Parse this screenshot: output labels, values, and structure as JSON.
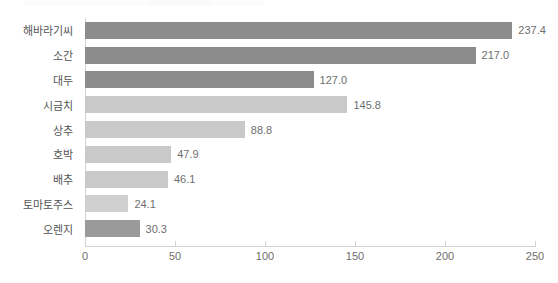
{
  "chart_data": {
    "type": "bar",
    "orientation": "horizontal",
    "title": "",
    "xlabel": "",
    "ylabel": "",
    "categories": [
      "해바라기씨",
      "소간",
      "대두",
      "시금치",
      "상추",
      "호박",
      "배추",
      "토마토주스",
      "오렌지"
    ],
    "values": [
      237.4,
      217.0,
      127.0,
      145.8,
      88.8,
      47.9,
      46.1,
      24.1,
      30.3
    ],
    "value_labels": [
      "237.4",
      "217.0",
      "127.0",
      "145.8",
      "88.8",
      "47.9",
      "46.1",
      "24.1",
      "30.3"
    ],
    "bar_colors": [
      "#8c8c8c",
      "#8c8c8c",
      "#8c8c8c",
      "#c9c9c9",
      "#c9c9c9",
      "#c9c9c9",
      "#c9c9c9",
      "#cfcfcf",
      "#9a9a9a"
    ],
    "xlim": [
      0,
      250
    ],
    "xticks": [
      0,
      50,
      100,
      150,
      200,
      250
    ],
    "xtick_labels": [
      "0",
      "50",
      "100",
      "150",
      "200",
      "250"
    ],
    "grid": false,
    "legend": "none",
    "axis_color": "#d2d2d2",
    "text_color": "#6e6e6e",
    "background": "#ffffff"
  }
}
